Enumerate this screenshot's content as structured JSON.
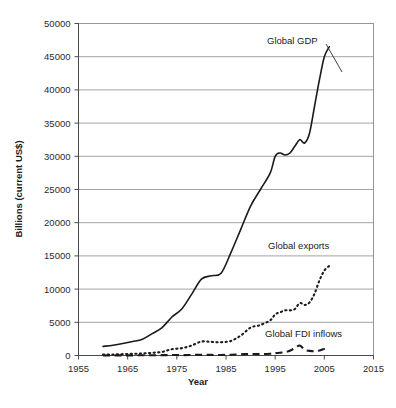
{
  "chart_data": {
    "type": "line",
    "title": "",
    "xlabel": "Year",
    "ylabel": "Billions (current US$)",
    "xlim": [
      1955,
      2015
    ],
    "ylim": [
      0,
      50000
    ],
    "xticks": [
      "1955",
      "1965",
      "1975",
      "1985",
      "1995",
      "2005",
      "2015"
    ],
    "yticks": [
      "0",
      "5000",
      "10000",
      "15000",
      "20000",
      "25000",
      "30000",
      "35000",
      "40000",
      "45000",
      "50000"
    ],
    "grid": "horizontal",
    "legend_position": "inline-annotations",
    "x": [
      1960,
      1962,
      1964,
      1966,
      1968,
      1970,
      1972,
      1974,
      1976,
      1978,
      1980,
      1982,
      1984,
      1986,
      1988,
      1990,
      1992,
      1994,
      1995,
      1996,
      1997,
      1998,
      1999,
      2000,
      2001,
      2002,
      2003,
      2004,
      2005,
      2006
    ],
    "series": [
      {
        "name": "Global GDP",
        "style": "solid",
        "values": [
          1370,
          1550,
          1800,
          2100,
          2450,
          3300,
          4200,
          5800,
          7000,
          9200,
          11500,
          12000,
          12400,
          15500,
          19000,
          22500,
          25000,
          27500,
          30000,
          30500,
          30200,
          30500,
          31500,
          32500,
          32000,
          33500,
          37500,
          41500,
          45000,
          46500
        ]
      },
      {
        "name": "Global exports",
        "style": "dotted",
        "values": [
          130,
          160,
          200,
          250,
          300,
          400,
          550,
          950,
          1100,
          1500,
          2100,
          2050,
          2000,
          2200,
          3000,
          4200,
          4600,
          5300,
          6200,
          6500,
          6800,
          6800,
          7000,
          7900,
          7600,
          8000,
          9300,
          11300,
          12800,
          13500
        ]
      },
      {
        "name": "Global FDI inflows",
        "style": "dashed",
        "values": [
          10,
          15,
          20,
          25,
          30,
          40,
          50,
          70,
          60,
          80,
          110,
          90,
          80,
          120,
          180,
          240,
          200,
          270,
          350,
          420,
          500,
          720,
          1100,
          1500,
          850,
          700,
          650,
          750,
          980,
          1000
        ]
      }
    ],
    "annotations": [
      {
        "text": "Global GDP",
        "series": "Global GDP"
      },
      {
        "text": "Global exports",
        "series": "Global exports"
      },
      {
        "text": "Global FDI inflows",
        "series": "Global FDI inflows"
      }
    ]
  }
}
